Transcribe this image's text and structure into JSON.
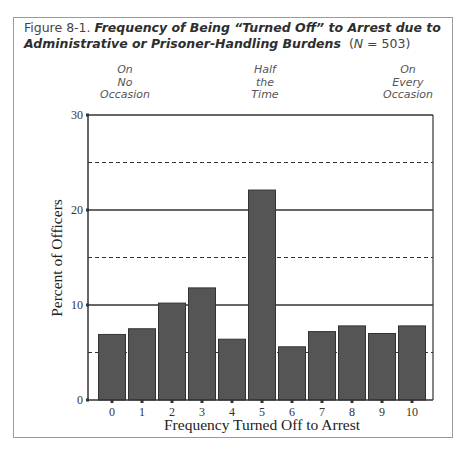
{
  "caption": {
    "lead": "Figure 8-1.",
    "title": "Frequency of Being “Turned Off” to Arrest due to Administrative or Prisoner-Handling Burdens",
    "n_label": "N",
    "n_rest": " = 503)"
  },
  "annotations": [
    {
      "lines": [
        "On",
        "No",
        "Occasion"
      ],
      "at_category": "0"
    },
    {
      "lines": [
        "Half",
        "the",
        "Time"
      ],
      "at_category": "5"
    },
    {
      "lines": [
        "On",
        "Every",
        "Occasion"
      ],
      "at_category": "10"
    }
  ],
  "colors": {
    "bar_fill": "#555555",
    "bar_stroke": "#333333",
    "axis": "#333333",
    "gridline_solid": "#333333",
    "gridline_dashed": "#333333"
  },
  "chart_data": {
    "type": "bar",
    "xlabel": "Frequency Turned Off to Arrest",
    "ylabel": "Percent of Officers",
    "categories": [
      "0",
      "1",
      "2",
      "3",
      "4",
      "5",
      "6",
      "7",
      "8",
      "9",
      "10"
    ],
    "values": [
      6.9,
      7.5,
      10.2,
      11.8,
      6.4,
      22.1,
      5.6,
      7.2,
      7.8,
      7.0,
      7.8
    ],
    "ylim": [
      0,
      30
    ],
    "yticks": [
      0,
      10,
      20,
      30
    ],
    "gridlines": {
      "solid": [
        10,
        20,
        30
      ],
      "dashed": [
        5,
        15,
        25
      ]
    },
    "grid": true,
    "legend": null,
    "annotations": [
      "On No Occasion (0)",
      "Half the Time (5)",
      "On Every Occasion (10)"
    ]
  }
}
